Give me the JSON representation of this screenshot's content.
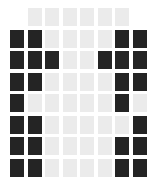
{
  "grid": {
    "cols": 8,
    "rows": 8,
    "colors": {
      "D": "#242424",
      "L": "#ebebeb"
    },
    "cells": [
      "_LLLLLL_",
      "DDLLLLDD",
      "DDDLLDDD",
      "DDLLLLDD",
      "DLLLLLDL",
      "DDLLLLLD",
      "DDLLLLDD",
      "DDLLLLDD"
    ]
  }
}
